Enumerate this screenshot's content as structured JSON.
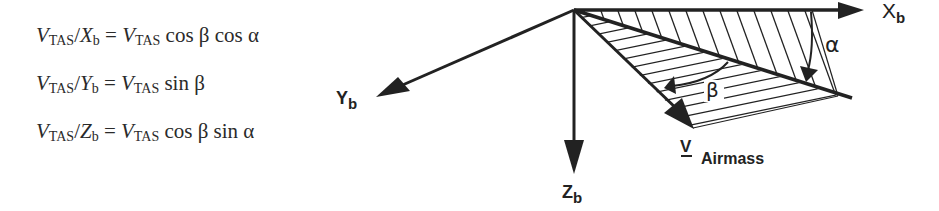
{
  "equations": [
    {
      "lhs_var": "V",
      "lhs_sub": "TAS",
      "axis": "X",
      "axis_sub": "b",
      "rhs_var": "V",
      "rhs_sub": "TAS",
      "rhs_func": "cos β cos α"
    },
    {
      "lhs_var": "V",
      "lhs_sub": "TAS",
      "axis": "Y",
      "axis_sub": "b",
      "rhs_var": "V",
      "rhs_sub": "TAS",
      "rhs_func": "sin β"
    },
    {
      "lhs_var": "V",
      "lhs_sub": "TAS",
      "axis": "Z",
      "axis_sub": "b",
      "rhs_var": "V",
      "rhs_sub": "TAS",
      "rhs_func": "cos β sin α"
    }
  ],
  "diagram": {
    "axes": {
      "x": {
        "label": "X",
        "sub": "b"
      },
      "y": {
        "label": "Y",
        "sub": "b"
      },
      "z": {
        "label": "Z",
        "sub": "b"
      }
    },
    "angles": {
      "alpha": "α",
      "beta": "β"
    },
    "velocity": {
      "symbol": "V",
      "label": "Airmass"
    },
    "colors": {
      "ink": "#222222",
      "background": "#ffffff"
    }
  }
}
